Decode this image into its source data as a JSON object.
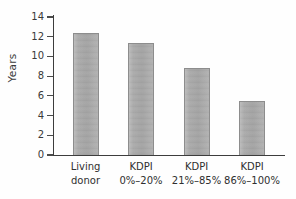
{
  "chart_data": {
    "type": "bar",
    "title": "",
    "xlabel": "",
    "ylabel": "Years",
    "categories": [
      "Living donor",
      "KDPI 0%-20%",
      "KDPI 21%-85%",
      "KDPI 86%-100%"
    ],
    "category_lines": [
      [
        "Living",
        "donor"
      ],
      [
        "KDPI",
        "0%–20%"
      ],
      [
        "KDPI",
        "21%–85%"
      ],
      [
        "KDPI",
        "86%–100%"
      ]
    ],
    "values": [
      12.4,
      11.4,
      8.8,
      5.5
    ],
    "ylim": [
      0,
      14
    ],
    "yticks": [
      0,
      2,
      4,
      6,
      8,
      10,
      12,
      14
    ],
    "ytick_labels": [
      "0",
      "2",
      "4",
      "6",
      "8",
      "10",
      "12",
      "14"
    ],
    "grid": false,
    "legend": null,
    "bar_color": "#a9a9a9",
    "axis_color": "#3d3d3d"
  }
}
